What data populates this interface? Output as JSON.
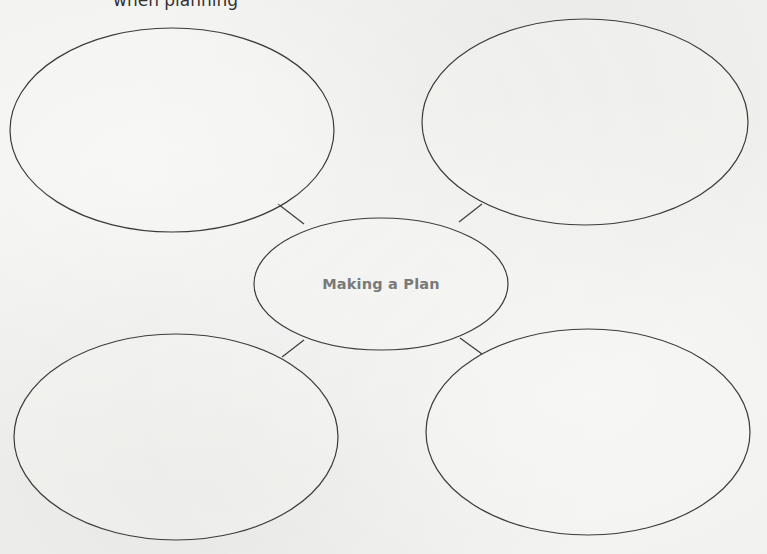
{
  "page": {
    "header_text_partial": "when planning"
  },
  "diagram": {
    "type": "web graphic organizer",
    "center": {
      "label": "Making a Plan",
      "shape": "ellipse",
      "cx": 381,
      "cy": 284,
      "rx": 127,
      "ry": 66,
      "text_color": "#7a7a7a"
    },
    "branches": [
      {
        "id": "top-left",
        "label": "",
        "cx": 172,
        "cy": 130,
        "rx": 162,
        "ry": 102,
        "connector": {
          "x1": 278,
          "y1": 204,
          "x2": 304,
          "y2": 224
        }
      },
      {
        "id": "top-right",
        "label": "",
        "cx": 585,
        "cy": 122,
        "rx": 163,
        "ry": 103,
        "connector": {
          "x1": 482,
          "y1": 204,
          "x2": 459,
          "y2": 222
        }
      },
      {
        "id": "bottom-left",
        "label": "",
        "cx": 176,
        "cy": 437,
        "rx": 162,
        "ry": 103,
        "connector": {
          "x1": 282,
          "y1": 357,
          "x2": 304,
          "y2": 340
        }
      },
      {
        "id": "bottom-right",
        "label": "",
        "cx": 588,
        "cy": 432,
        "rx": 162,
        "ry": 103,
        "connector": {
          "x1": 460,
          "y1": 338,
          "x2": 482,
          "y2": 354
        }
      }
    ],
    "colors": {
      "stroke": "#3c3c3c",
      "paper": "#efefed"
    }
  }
}
